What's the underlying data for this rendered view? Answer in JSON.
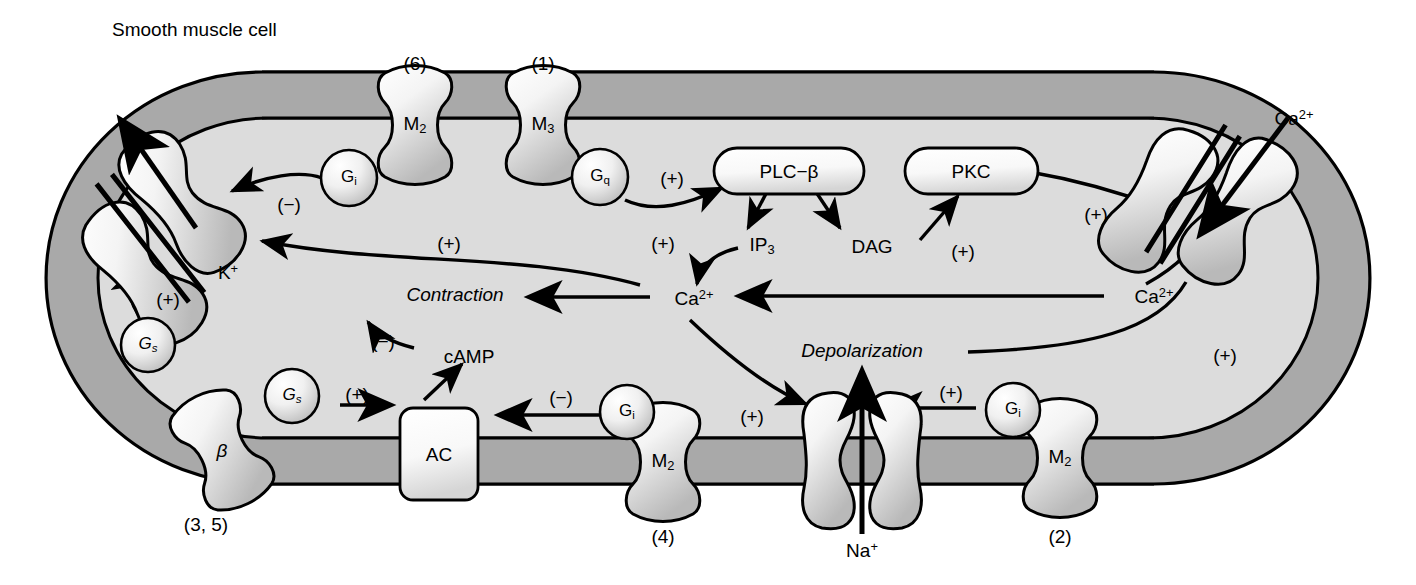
{
  "figure": {
    "title": "Smooth muscle cell",
    "kind": "cell-signaling-diagram"
  },
  "colors": {
    "membrane": "#a9a9a9",
    "cytoplasm": "#dcdcdc",
    "protein_fill": "#e8e8e8",
    "outline": "#000000",
    "background": "#ffffff"
  },
  "receptors": [
    {
      "id": "m2-top-left",
      "label": "M",
      "sublabel": "2",
      "number": "(6)"
    },
    {
      "id": "m3-top",
      "label": "M",
      "sublabel": "3",
      "number": "(1)"
    },
    {
      "id": "beta-left",
      "label": "β",
      "sublabel": "",
      "number": "(3, 5)"
    },
    {
      "id": "m2-bottom-mid",
      "label": "M",
      "sublabel": "2",
      "number": "(4)"
    },
    {
      "id": "m2-bottom-right",
      "label": "M",
      "sublabel": "2",
      "number": "(2)"
    }
  ],
  "channels": [
    {
      "id": "k-channel",
      "ion": "K",
      "charge": "+",
      "direction": "out"
    },
    {
      "id": "ca-channel",
      "ion": "Ca",
      "charge": "2+",
      "direction": "in"
    },
    {
      "id": "na-channel",
      "ion": "Na",
      "charge": "+",
      "direction": "in"
    }
  ],
  "g_proteins": [
    {
      "id": "gi-top-left",
      "label": "G",
      "sublabel": "i"
    },
    {
      "id": "gq-top",
      "label": "G",
      "sublabel": "q"
    },
    {
      "id": "gs-left-upper",
      "label": "G",
      "sublabel": "s"
    },
    {
      "id": "gs-left-lower",
      "label": "G",
      "sublabel": "s"
    },
    {
      "id": "gi-bottom-mid",
      "label": "G",
      "sublabel": "i"
    },
    {
      "id": "gi-bottom-right",
      "label": "G",
      "sublabel": "i"
    }
  ],
  "enzymes": [
    {
      "id": "plc-beta",
      "label": "PLC−β"
    },
    {
      "id": "pkc",
      "label": "PKC"
    },
    {
      "id": "ac",
      "label": "AC"
    }
  ],
  "messengers": [
    {
      "id": "ip3",
      "label": "IP",
      "sublabel": "3"
    },
    {
      "id": "dag",
      "label": "DAG",
      "sublabel": ""
    },
    {
      "id": "camp",
      "label": "cAMP",
      "sublabel": ""
    },
    {
      "id": "ca-cytoplasm",
      "label": "Ca",
      "sup": "2+"
    },
    {
      "id": "ca-inner-right",
      "label": "Ca",
      "sup": "2+"
    },
    {
      "id": "ca-extracell",
      "label": "Ca",
      "sup": "2+"
    }
  ],
  "outcomes": [
    {
      "id": "contraction",
      "label": "Contraction"
    },
    {
      "id": "depolarization",
      "label": "Depolarization"
    }
  ],
  "ion_labels": [
    {
      "id": "k-label",
      "label": "K",
      "sup": "+"
    },
    {
      "id": "na-label",
      "label": "Na",
      "sup": "+"
    },
    {
      "id": "ca-out-label",
      "label": "Ca",
      "sup": "2+"
    }
  ],
  "signs": [
    {
      "id": "sign-gi-k",
      "label": "(−)"
    },
    {
      "id": "sign-gq-plc",
      "label": "(+)"
    },
    {
      "id": "sign-pkc-ca",
      "label": "(+)"
    },
    {
      "id": "sign-dag-pkc",
      "label": "(+)"
    },
    {
      "id": "sign-ip3-ca",
      "label": "(+)"
    },
    {
      "id": "sign-ca-k",
      "label": "(+)"
    },
    {
      "id": "sign-gs-k",
      "label": "(+)"
    },
    {
      "id": "sign-camp-contr",
      "label": "(−)"
    },
    {
      "id": "sign-gs-ac",
      "label": "(+)"
    },
    {
      "id": "sign-gi-ac",
      "label": "(−)"
    },
    {
      "id": "sign-ca-depol",
      "label": "(+)"
    },
    {
      "id": "sign-gi-na",
      "label": "(+)"
    },
    {
      "id": "sign-depol-ca",
      "label": "(+)"
    }
  ]
}
